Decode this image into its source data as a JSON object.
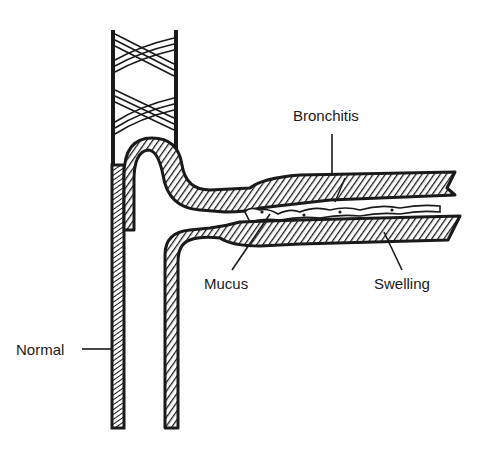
{
  "diagram": {
    "type": "medical-illustration",
    "labels": {
      "bronchitis": "Bronchitis",
      "mucus": "Mucus",
      "swelling": "Swelling",
      "normal": "Normal"
    },
    "colors": {
      "ink": "#1a1a1a",
      "background": "#ffffff"
    }
  }
}
